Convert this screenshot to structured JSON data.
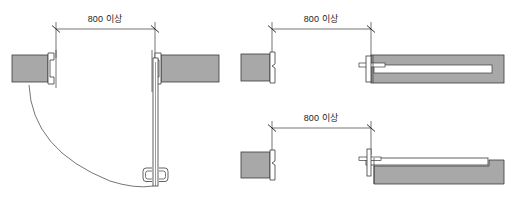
{
  "diagram": {
    "background_color": "#ffffff",
    "line_color": "#3a3a3a",
    "wall_fill_color": "#a8a8a8",
    "leaf_fill_color": "#ffffff",
    "text_color": "#1c1c1c",
    "panels": [
      {
        "id": "swing-door",
        "name": "hinged-swing-door-plan",
        "dimension": {
          "label": "800 이상",
          "value": "800",
          "qualifier": "이상",
          "terminator": "tick"
        },
        "parts": [
          "left-wall-block",
          "left-door-jamb",
          "right-wall-block",
          "right-door-jamb",
          "door-leaf",
          "door-pull-handle",
          "swing-arc"
        ]
      },
      {
        "id": "pocket-sliding-door",
        "name": "pocket-sliding-door-plan",
        "dimension": {
          "label": "800 이상",
          "value": "800",
          "qualifier": "이상",
          "terminator": "tick"
        },
        "parts": [
          "left-wall-block",
          "left-door-jamb",
          "pocket-wall-body",
          "recessed-leaf-slot",
          "leading-edge-stile",
          "track-rail"
        ]
      },
      {
        "id": "surface-sliding-door",
        "name": "surface-mounted-sliding-door-plan",
        "dimension": {
          "label": "800 이상",
          "value": "800",
          "qualifier": "이상",
          "terminator": "tick"
        },
        "parts": [
          "left-wall-block",
          "left-door-jamb",
          "wall-body",
          "sliding-leaf",
          "leading-edge-pull",
          "track-rail"
        ]
      }
    ]
  }
}
